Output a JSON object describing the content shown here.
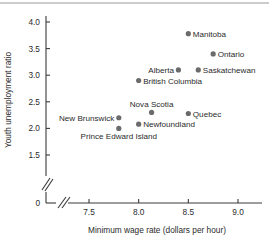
{
  "chart_data": {
    "type": "scatter",
    "title": "",
    "xlabel": "Minimum wage rate (dollars per hour)",
    "ylabel": "Youth unemployment ratio",
    "xlim": [
      7.35,
      9.12
    ],
    "ylim": [
      1.38,
      4.08
    ],
    "x_ticks": [
      "7.5",
      "8.0",
      "8.5",
      "9.0"
    ],
    "x_tick_values": [
      7.5,
      8.0,
      8.5,
      9.0
    ],
    "y_ticks": [
      "1.5",
      "2.0",
      "2.5",
      "3.0",
      "3.5",
      "4.0"
    ],
    "y_tick_values": [
      1.5,
      2.0,
      2.5,
      3.0,
      3.5,
      4.0
    ],
    "origin_tick_label": "0",
    "x_axis_break": true,
    "y_axis_break": true,
    "grid": false,
    "legend": "none",
    "marker_color": "#6b6b6b",
    "axis_color": "#3a3a3a",
    "points": [
      {
        "label": "Manitoba",
        "x": 8.5,
        "y": 3.78,
        "label_side": "right"
      },
      {
        "label": "Ontario",
        "x": 8.75,
        "y": 3.4,
        "label_side": "right"
      },
      {
        "label": "Alberta",
        "x": 8.4,
        "y": 3.1,
        "label_side": "left"
      },
      {
        "label": "Saskatchewan",
        "x": 8.6,
        "y": 3.1,
        "label_side": "right"
      },
      {
        "label": "British Columbia",
        "x": 8.0,
        "y": 2.9,
        "label_side": "right"
      },
      {
        "label": "Nova Scotia",
        "x": 8.13,
        "y": 2.3,
        "label_side": "above"
      },
      {
        "label": "Quebec",
        "x": 8.5,
        "y": 2.28,
        "label_side": "right"
      },
      {
        "label": "New Brunswick",
        "x": 7.8,
        "y": 2.2,
        "label_side": "left"
      },
      {
        "label": "Newfoundland",
        "x": 8.0,
        "y": 2.08,
        "label_side": "right"
      },
      {
        "label": "Prince Edward Island",
        "x": 7.8,
        "y": 2.0,
        "label_side": "below"
      }
    ]
  }
}
